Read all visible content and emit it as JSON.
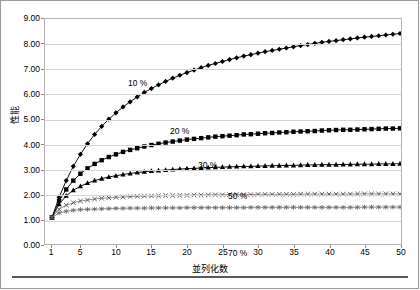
{
  "chart": {
    "axis": {
      "ylabel": "性能",
      "xlabel": "並列化数",
      "yticks": [
        "0.00",
        "1.00",
        "2.00",
        "3.00",
        "4.00",
        "5.00",
        "6.00",
        "7.00",
        "8.00",
        "9.00"
      ],
      "xticks": [
        "1",
        "5",
        "10",
        "15",
        "20",
        "25",
        "30",
        "35",
        "40",
        "45",
        "50"
      ]
    },
    "labels": [
      {
        "text": "10 %",
        "x": 128,
        "y": 78
      },
      {
        "text": "20 %",
        "x": 170,
        "y": 126
      },
      {
        "text": "30 %",
        "x": 198,
        "y": 160
      },
      {
        "text": "50 %",
        "x": 228,
        "y": 191
      },
      {
        "text": "70 %",
        "x": 228,
        "y": 248
      }
    ]
  },
  "chart_data": {
    "type": "line",
    "title": "",
    "xlabel": "並列化数",
    "ylabel": "性能",
    "xlim": [
      1,
      50
    ],
    "ylim": [
      0,
      9
    ],
    "grid": true,
    "legend": "inline-annotations",
    "x": [
      1,
      2,
      3,
      4,
      5,
      6,
      7,
      8,
      9,
      10,
      11,
      12,
      13,
      14,
      15,
      16,
      17,
      18,
      19,
      20,
      21,
      22,
      23,
      24,
      25,
      26,
      27,
      28,
      29,
      30,
      31,
      32,
      33,
      34,
      35,
      36,
      37,
      38,
      39,
      40,
      41,
      42,
      43,
      44,
      45,
      46,
      47,
      48,
      49,
      50
    ],
    "series": [
      {
        "name": "10 %",
        "marker": "diamond",
        "values": [
          1.0,
          1.82,
          2.5,
          3.08,
          3.57,
          4.0,
          4.38,
          4.71,
          5.0,
          5.26,
          5.5,
          5.71,
          5.91,
          6.09,
          6.25,
          6.4,
          6.54,
          6.67,
          6.79,
          6.9,
          7.0,
          7.1,
          7.19,
          7.27,
          7.35,
          7.43,
          7.5,
          7.57,
          7.63,
          7.69,
          7.75,
          7.8,
          7.85,
          7.9,
          7.95,
          8.0,
          8.04,
          8.09,
          8.13,
          8.17,
          8.2,
          8.24,
          8.27,
          8.31,
          8.34,
          8.37,
          8.4,
          8.43,
          8.46,
          8.49
        ]
      },
      {
        "name": "20 %",
        "marker": "square",
        "values": [
          1.0,
          1.67,
          2.14,
          2.5,
          2.78,
          3.0,
          3.18,
          3.33,
          3.46,
          3.57,
          3.67,
          3.75,
          3.82,
          3.89,
          3.95,
          4.0,
          4.05,
          4.09,
          4.13,
          4.17,
          4.2,
          4.23,
          4.26,
          4.29,
          4.31,
          4.33,
          4.35,
          4.38,
          4.39,
          4.41,
          4.43,
          4.44,
          4.46,
          4.47,
          4.49,
          4.5,
          4.51,
          4.52,
          4.54,
          4.55,
          4.56,
          4.57,
          4.57,
          4.58,
          4.59,
          4.6,
          4.61,
          4.62,
          4.62,
          4.63
        ]
      },
      {
        "name": "30 %",
        "marker": "triangle",
        "values": [
          1.0,
          1.54,
          1.88,
          2.11,
          2.27,
          2.4,
          2.5,
          2.58,
          2.65,
          2.7,
          2.75,
          2.79,
          2.83,
          2.86,
          2.89,
          2.91,
          2.93,
          2.95,
          2.97,
          2.99,
          3.0,
          3.01,
          3.03,
          3.04,
          3.05,
          3.06,
          3.07,
          3.08,
          3.08,
          3.09,
          3.1,
          3.11,
          3.11,
          3.12,
          3.12,
          3.13,
          3.14,
          3.14,
          3.15,
          3.15,
          3.15,
          3.16,
          3.16,
          3.17,
          3.17,
          3.17,
          3.18,
          3.18,
          3.18,
          3.19
        ]
      },
      {
        "name": "50 %",
        "marker": "cross",
        "values": [
          1.0,
          1.33,
          1.5,
          1.6,
          1.67,
          1.71,
          1.75,
          1.78,
          1.8,
          1.82,
          1.83,
          1.85,
          1.86,
          1.87,
          1.88,
          1.88,
          1.89,
          1.89,
          1.9,
          1.9,
          1.91,
          1.91,
          1.92,
          1.92,
          1.92,
          1.93,
          1.93,
          1.93,
          1.93,
          1.94,
          1.94,
          1.94,
          1.94,
          1.94,
          1.94,
          1.95,
          1.95,
          1.95,
          1.95,
          1.95,
          1.95,
          1.95,
          1.95,
          1.96,
          1.96,
          1.96,
          1.96,
          1.96,
          1.96,
          1.96
        ]
      },
      {
        "name": "70 %",
        "marker": "asterisk",
        "values": [
          1.0,
          1.18,
          1.25,
          1.29,
          1.32,
          1.33,
          1.34,
          1.35,
          1.36,
          1.37,
          1.37,
          1.38,
          1.38,
          1.38,
          1.39,
          1.39,
          1.39,
          1.39,
          1.39,
          1.4,
          1.4,
          1.4,
          1.4,
          1.4,
          1.4,
          1.4,
          1.4,
          1.4,
          1.41,
          1.41,
          1.41,
          1.41,
          1.41,
          1.41,
          1.41,
          1.41,
          1.41,
          1.41,
          1.41,
          1.41,
          1.41,
          1.41,
          1.41,
          1.41,
          1.42,
          1.42,
          1.42,
          1.42,
          1.42,
          1.42
        ]
      }
    ]
  }
}
